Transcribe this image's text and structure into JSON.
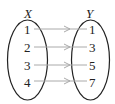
{
  "diagram": {
    "type": "mapping",
    "sets": [
      {
        "name": "X",
        "elements": [
          "1",
          "2",
          "3",
          "4"
        ]
      },
      {
        "name": "Y",
        "elements": [
          "1",
          "3",
          "5",
          "7"
        ]
      }
    ],
    "mappings": [
      {
        "from": "1",
        "to": "1"
      },
      {
        "from": "2",
        "to": "3"
      },
      {
        "from": "3",
        "to": "5"
      },
      {
        "from": "4",
        "to": "7"
      }
    ],
    "colors": {
      "ellipse": "#222222",
      "arrow": "#aaaaaa",
      "text": "#222222"
    }
  }
}
